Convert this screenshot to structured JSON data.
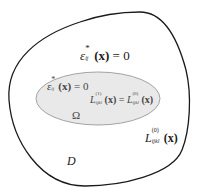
{
  "diagram": {
    "outer_region": {
      "name": "D",
      "stroke": "#1a1a1a",
      "fill": "#ffffff"
    },
    "inner_region": {
      "name": "Ω",
      "stroke": "#9a9a9a",
      "fill": "#e9e9e9"
    },
    "labels": {
      "outer_eigenstrain": {
        "symbol": "ε",
        "superscript": "*",
        "subscript": "ij",
        "argument": "(x)",
        "equation_rhs": "= 0"
      },
      "inner_eigenstrain": {
        "symbol": "ε",
        "superscript": "*",
        "subscript": "ij",
        "argument": "(x)",
        "equation_rhs": "= 0"
      },
      "inner_stiffness": {
        "lhs_symbol": "L",
        "lhs_superscript": "(1)",
        "lhs_subscript": "ijkl",
        "lhs_argument": "(x)",
        "equals": "=",
        "rhs_symbol": "L",
        "rhs_superscript": "(0)",
        "rhs_subscript": "ijkl",
        "rhs_argument": "(x)"
      },
      "outer_stiffness": {
        "symbol": "L",
        "superscript": "(0)",
        "subscript": "ijkl",
        "argument": "(x)"
      },
      "omega_label": "Ω",
      "domain_label": "D"
    }
  }
}
